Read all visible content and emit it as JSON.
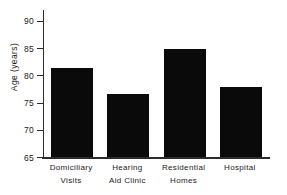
{
  "chart_data": {
    "type": "bar",
    "title": "",
    "xlabel": "",
    "ylabel": "Age  (years)",
    "ylim": [
      65,
      92
    ],
    "yticks": [
      65,
      70,
      75,
      80,
      85,
      90
    ],
    "grid": false,
    "legend": "none",
    "bar_color": "#0a0a0a",
    "axis_color": "#2b2b2b",
    "categories": [
      "Domiciliary Visits",
      "Hearing Aid Clinic",
      "Residential Homes",
      "Hospital"
    ],
    "category_lines": [
      [
        "Domiciliary",
        "Visits"
      ],
      [
        "Hearing",
        "Aid  Clinic"
      ],
      [
        "Residential",
        "Homes"
      ],
      [
        "Hospital"
      ]
    ],
    "values": [
      81.4,
      76.5,
      84.9,
      77.9
    ]
  }
}
